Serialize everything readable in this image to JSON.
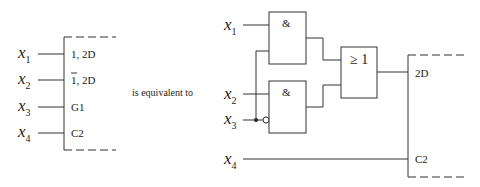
{
  "left_symbol": {
    "inputs": [
      {
        "var": "x",
        "sub": "1",
        "label": "1, 2D"
      },
      {
        "var": "x",
        "sub": "2",
        "label_bar": "1",
        "label_rest": ", 2D"
      },
      {
        "var": "x",
        "sub": "3",
        "label": "G1"
      },
      {
        "var": "x",
        "sub": "4",
        "label": "C2"
      }
    ]
  },
  "middle_text": "is equivalent to",
  "right_circuit": {
    "inputs": [
      {
        "var": "x",
        "sub": "1"
      },
      {
        "var": "x",
        "sub": "2"
      },
      {
        "var": "x",
        "sub": "3"
      },
      {
        "var": "x",
        "sub": "4"
      }
    ],
    "gates": [
      {
        "type": "AND",
        "label": "&"
      },
      {
        "type": "AND",
        "label": "&"
      },
      {
        "type": "OR",
        "label": "≥ 1"
      }
    ],
    "flipflop_labels": [
      "2D",
      "C2"
    ]
  }
}
